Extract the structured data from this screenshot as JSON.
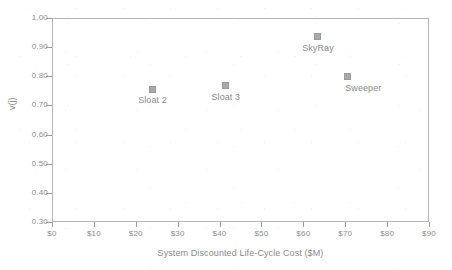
{
  "chart_data": {
    "type": "scatter",
    "title": "",
    "xlabel": "System Discounted Life-Cycle Cost ($M)",
    "ylabel": "v(j)",
    "xlim": [
      0,
      90
    ],
    "ylim": [
      0.3,
      1.0
    ],
    "grid": false,
    "legend": "none",
    "x_tick_labels": [
      "$0",
      "$10",
      "$20",
      "$30",
      "$40",
      "$50",
      "$60",
      "$70",
      "$80",
      "$90"
    ],
    "x_tick_values": [
      0,
      10,
      20,
      30,
      40,
      50,
      60,
      70,
      80,
      90
    ],
    "y_tick_labels": [
      "0.30",
      "0.40",
      "0.50",
      "0.60",
      "0.70",
      "0.80",
      "0.90",
      "1.00"
    ],
    "y_tick_values": [
      0.3,
      0.4,
      0.5,
      0.6,
      0.7,
      0.8,
      0.9,
      1.0
    ],
    "marker_color": "#a9a9a9",
    "marker_shape": "square",
    "points": [
      {
        "label": "Sloat 2",
        "x": 24.0,
        "y": 0.755,
        "label_position": "below"
      },
      {
        "label": "Sloat 3",
        "x": 41.5,
        "y": 0.767,
        "label_position": "below"
      },
      {
        "label": "SkyRay",
        "x": 63.5,
        "y": 0.935,
        "label_position": "below"
      },
      {
        "label": "Sweeper",
        "x": 70.5,
        "y": 0.8,
        "label_position": "below-right"
      }
    ]
  },
  "colors": {
    "axis": "#9d9d9d",
    "frame": "#b5b5b5",
    "text": "#8a8a8a",
    "marker": "#a9a9a9",
    "background": "#ffffff"
  }
}
